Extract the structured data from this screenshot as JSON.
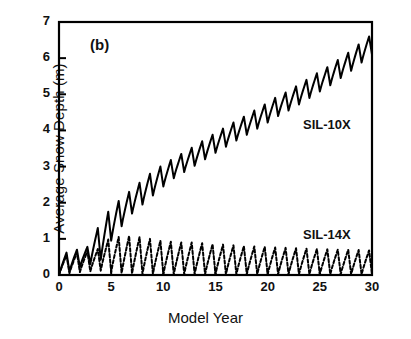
{
  "chart_data": {
    "type": "line",
    "title": "",
    "panel_label": "(b)",
    "xlabel": "Model Year",
    "ylabel": "Average Snow Depth (m)",
    "xlim": [
      0,
      30
    ],
    "ylim": [
      0,
      7
    ],
    "xticks": [
      0,
      5,
      10,
      15,
      20,
      25,
      30
    ],
    "yticks": [
      0,
      1,
      2,
      3,
      4,
      5,
      6,
      7
    ],
    "grid": false,
    "legend_position": "inline-annotation",
    "series": [
      {
        "name": "SIL-10X",
        "style": "solid",
        "color": "#000000",
        "annotation_xy": [
          24.0,
          4.35
        ],
        "description": "Accumulating snowpack with annual sawtooth cycle; rises from ~0 m at year 0 to ~6.6 m peak at year 30.",
        "annual_peaks": [
          0.62,
          0.7,
          0.78,
          1.3,
          1.75,
          2.05,
          2.3,
          2.55,
          2.8,
          3.0,
          3.18,
          3.35,
          3.52,
          3.7,
          3.88,
          4.05,
          4.22,
          4.38,
          4.55,
          4.72,
          4.9,
          5.05,
          5.22,
          5.4,
          5.58,
          5.75,
          5.95,
          6.15,
          6.38,
          6.6
        ],
        "annual_minima": [
          0.1,
          0.22,
          0.3,
          0.42,
          0.95,
          1.35,
          1.7,
          1.95,
          2.2,
          2.45,
          2.68,
          2.85,
          3.02,
          3.2,
          3.38,
          3.55,
          3.72,
          3.88,
          4.05,
          4.22,
          4.4,
          4.55,
          4.72,
          4.9,
          5.08,
          5.25,
          5.45,
          5.65,
          5.88,
          6.1
        ]
      },
      {
        "name": "SIL-14X",
        "style": "dashed",
        "color": "#000000",
        "annotation_xy": [
          24.0,
          1.3
        ],
        "description": "Seasonally melting snowpack; oscillates between ~0 m and ~0.7-1.1 m with no long-term accumulation.",
        "annual_peaks": [
          0.55,
          0.62,
          0.66,
          0.72,
          0.98,
          1.05,
          1.08,
          1.05,
          1.0,
          0.95,
          0.92,
          0.9,
          0.9,
          0.88,
          0.85,
          0.84,
          0.82,
          0.8,
          0.79,
          0.78,
          0.76,
          0.75,
          0.74,
          0.73,
          0.72,
          0.71,
          0.7,
          0.7,
          0.69,
          0.68
        ],
        "annual_minima": [
          0.05,
          0.08,
          0.1,
          0.12,
          0.08,
          0.05,
          0.04,
          0.03,
          0.03,
          0.02,
          0.02,
          0.02,
          0.02,
          0.02,
          0.02,
          0.02,
          0.02,
          0.02,
          0.02,
          0.02,
          0.02,
          0.02,
          0.02,
          0.02,
          0.02,
          0.02,
          0.02,
          0.02,
          0.02,
          0.02
        ]
      }
    ]
  },
  "axis": {
    "x_tick_labels": [
      "0",
      "5",
      "10",
      "15",
      "20",
      "25",
      "30"
    ],
    "y_tick_labels": [
      "0",
      "1",
      "2",
      "3",
      "4",
      "5",
      "6",
      "7"
    ]
  }
}
